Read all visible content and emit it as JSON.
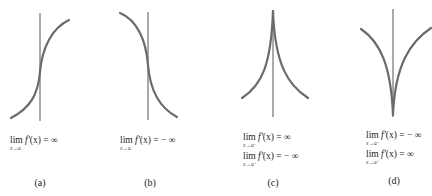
{
  "figure": {
    "panels": [
      {
        "id": "a",
        "caption": "(a)",
        "shape": "increasing curve with vertical tangent",
        "limits": [
          {
            "lim": "lim",
            "sub": "x→a",
            "fn": "f′",
            "arg": "(x)",
            "rel": " = ",
            "val": "∞"
          }
        ]
      },
      {
        "id": "b",
        "caption": "(b)",
        "shape": "decreasing curve with vertical tangent",
        "limits": [
          {
            "lim": "lim",
            "sub": "x→a",
            "fn": "f′",
            "arg": "(x)",
            "rel": " = ",
            "val": "− ∞"
          }
        ]
      },
      {
        "id": "c",
        "caption": "(c)",
        "shape": "cusp pointing up",
        "limits": [
          {
            "lim": "lim",
            "sub": "x→a⁻",
            "fn": "f′",
            "arg": "(x)",
            "rel": " = ",
            "val": "∞"
          },
          {
            "lim": "lim",
            "sub": "x→a⁺",
            "fn": "f′",
            "arg": "(x)",
            "rel": " = ",
            "val": "− ∞"
          }
        ]
      },
      {
        "id": "d",
        "caption": "(d)",
        "shape": "cusp pointing down",
        "limits": [
          {
            "lim": "lim",
            "sub": "x→a⁻",
            "fn": "f′",
            "arg": "(x)",
            "rel": " = ",
            "val": "− ∞"
          },
          {
            "lim": "lim",
            "sub": "x→a⁺",
            "fn": "f′",
            "arg": "(x)",
            "rel": " = ",
            "val": "∞"
          }
        ]
      }
    ],
    "colors": {
      "curve": "#6b6b6b",
      "vertical_line": "#555555",
      "text": "#222222"
    }
  }
}
